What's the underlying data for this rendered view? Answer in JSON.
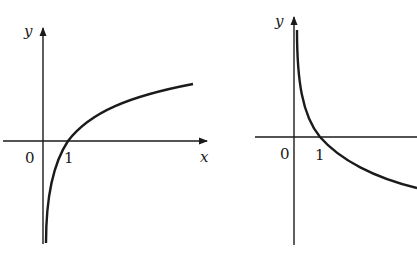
{
  "figures": [
    {
      "name": "logarithm-increasing",
      "description": "Graph of y = log_a x with a > 1",
      "axes": {
        "x_label": "x",
        "y_label": "y",
        "origin_label": "0"
      },
      "tick_labels": [
        "1"
      ],
      "curve": "increasing, vertical asymptote at x=0, passes through (1,0)"
    },
    {
      "name": "logarithm-decreasing",
      "description": "Graph of y = log_a x with 0 < a < 1",
      "axes": {
        "y_label": "y",
        "origin_label": "0"
      },
      "tick_labels": [
        "1"
      ],
      "curve": "decreasing, vertical asymptote at x=0, passes through (1,0)"
    }
  ],
  "colors": {
    "stroke": "#1a1a1a",
    "background": "#ffffff"
  }
}
